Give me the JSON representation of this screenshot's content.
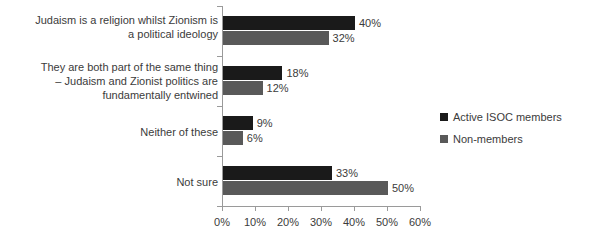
{
  "chart_data": {
    "type": "bar",
    "orientation": "horizontal",
    "title": "",
    "xlabel": "",
    "ylabel": "",
    "xlim": [
      0,
      60
    ],
    "xticks": [
      "0%",
      "10%",
      "20%",
      "30%",
      "40%",
      "50%",
      "60%"
    ],
    "grid": false,
    "legend_position": "right",
    "categories": [
      "Judaism is a religion whilst Zionism is\na political ideology",
      "They are both part of the same thing\n– Judaism and Zionist politics are\nfundamentally entwined",
      "Neither of these",
      "Not sure"
    ],
    "series": [
      {
        "name": "Active ISOC members",
        "color": "#1a1a1a",
        "values": [
          40,
          18,
          9,
          33
        ],
        "labels": [
          "40%",
          "18%",
          "9%",
          "33%"
        ]
      },
      {
        "name": "Non-members",
        "color": "#595959",
        "values": [
          32,
          12,
          6,
          50
        ],
        "labels": [
          "32%",
          "12%",
          "6%",
          "50%"
        ]
      }
    ]
  },
  "legend": {
    "items": [
      {
        "label": "Active ISOC members",
        "color": "#1a1a1a"
      },
      {
        "label": "Non-members",
        "color": "#595959"
      }
    ]
  },
  "axis": {
    "ticks": [
      "0%",
      "10%",
      "20%",
      "30%",
      "40%",
      "50%",
      "60%"
    ]
  }
}
